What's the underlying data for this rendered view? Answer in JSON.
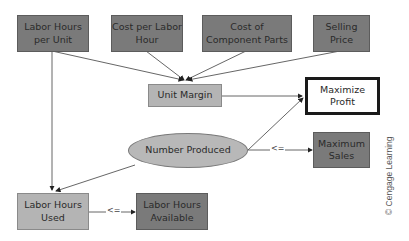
{
  "diagram": {
    "nodes": {
      "labor_hours_per_unit": {
        "line1": "Labor Hours",
        "line2": "per Unit",
        "type": "parameter"
      },
      "cost_per_labor_hour": {
        "line1": "Cost per Labor",
        "line2": "Hour",
        "type": "parameter"
      },
      "cost_of_component_parts": {
        "line1": "Cost of",
        "line2": "Component Parts",
        "type": "parameter"
      },
      "selling_price": {
        "line1": "Selling",
        "line2": "Price",
        "type": "parameter"
      },
      "unit_margin": {
        "line1": "Unit Margin",
        "type": "calculation"
      },
      "maximize_profit": {
        "line1": "Maximize",
        "line2": "Profit",
        "type": "objective"
      },
      "number_produced": {
        "line1": "Number Produced",
        "type": "decision"
      },
      "maximum_sales": {
        "line1": "Maximum",
        "line2": "Sales",
        "type": "parameter"
      },
      "labor_hours_used": {
        "line1": "Labor Hours",
        "line2": "Used",
        "type": "calculation"
      },
      "labor_hours_available": {
        "line1": "Labor Hours",
        "line2": "Available",
        "type": "parameter"
      }
    },
    "edges": [
      {
        "from": "Labor Hours per Unit",
        "to": "Unit Margin"
      },
      {
        "from": "Cost per Labor Hour",
        "to": "Unit Margin"
      },
      {
        "from": "Cost of Component Parts",
        "to": "Unit Margin"
      },
      {
        "from": "Selling Price",
        "to": "Unit Margin"
      },
      {
        "from": "Unit Margin",
        "to": "Maximize Profit"
      },
      {
        "from": "Number Produced",
        "to": "Maximize Profit"
      },
      {
        "from": "Number Produced",
        "to": "Maximum Sales",
        "label": "<="
      },
      {
        "from": "Labor Hours per Unit",
        "to": "Labor Hours Used"
      },
      {
        "from": "Number Produced",
        "to": "Labor Hours Used"
      },
      {
        "from": "Labor Hours Used",
        "to": "Labor Hours Available",
        "label": "<="
      }
    ],
    "constraint_labels": {
      "sales": "<=",
      "labor": "<="
    },
    "credit": "© Cengage Learning"
  }
}
